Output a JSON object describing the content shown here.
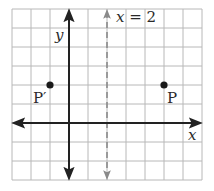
{
  "diagram": {
    "grid": {
      "x_min": -3,
      "x_max": 7,
      "y_min": -3,
      "y_max": 6,
      "cell_px": 19,
      "origin_px": [
        69,
        123
      ],
      "grid_color": "#b8b8b8",
      "axis_color": "#222222",
      "dashed_color": "#8a8a8a"
    },
    "axes": {
      "x_label": "x",
      "y_label": "y"
    },
    "line": {
      "label_var": "x",
      "label_eq": " = 2",
      "x_value": 2,
      "style": "dashed"
    },
    "points": [
      {
        "name": "P",
        "label": "P",
        "x": 5,
        "y": 2
      },
      {
        "name": "P-prime",
        "label": "P′",
        "x": -1,
        "y": 2
      }
    ]
  }
}
